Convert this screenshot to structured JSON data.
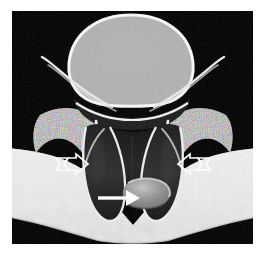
{
  "figure": {
    "kind": "medical-imaging-illustration",
    "modality_look": "axial-cross-section",
    "caption": "",
    "background_color": "#ffffff",
    "scan_background_color": "#000000",
    "frame": {
      "x": 12,
      "y": 11,
      "width": 241,
      "height": 233
    }
  },
  "palette": {
    "black": "#000000",
    "canal_dark": "#1d1d1d",
    "nerve_dark": "#262626",
    "bone_mid": "#9a9a9a",
    "bone_speckle_light": "#cfcfcf",
    "bone_speckle_dark": "#6d6d6d",
    "cortex_bright": "#f2f2f2",
    "soft_tissue": "#e2e2e2",
    "soft_tissue_shadow": "#bdbdbd",
    "fragment_gray": "#8d8d8d",
    "fragment_highlight": "#c8c8c8",
    "arrow_white": "#ffffff"
  },
  "anatomy": {
    "vertebral_body": {
      "label": "vertebral body",
      "fill": "#a6a6a6",
      "rim": "#f0f0f0",
      "texture": "trabecular-speckle",
      "center": {
        "x": 119,
        "y": 52
      },
      "radius_x": 62,
      "radius_y": 47
    },
    "posterior_cortex": {
      "label": "posterior vertebral cortex",
      "fill": "#efefef"
    },
    "disc_margin": {
      "label": "posterior disc margin",
      "fill": "#1f1f1f"
    },
    "spinal_canal": {
      "label": "spinal canal / thecal sac",
      "fill": "#1b1b1b",
      "outline": "#f4f4f4"
    },
    "nerve_root_left": {
      "label": "left nerve root sleeve",
      "fill": "#242424",
      "outline": "#f0f0f0"
    },
    "nerve_root_right": {
      "label": "right nerve root sleeve",
      "fill": "#242424",
      "outline": "#f0f0f0"
    },
    "lamina_left": {
      "label": "left lamina / facet",
      "fill": "#9c9c9c",
      "texture": "trabecular-speckle"
    },
    "lamina_right": {
      "label": "right lamina / facet",
      "fill": "#9c9c9c",
      "texture": "trabecular-speckle"
    },
    "transverse_process_left": {
      "label": "left transverse process",
      "fill": "#b4b4b4"
    },
    "transverse_process_right": {
      "label": "right transverse process",
      "fill": "#b4b4b4"
    },
    "paraspinal_tissue": {
      "label": "paraspinal soft tissue band",
      "fill": "#e4e4e4",
      "texture": "mottled"
    },
    "disc_fragment": {
      "label": "herniated disc fragment",
      "fill": "#8d8d8d",
      "highlight": "#c6c6c6",
      "center": {
        "x": 136,
        "y": 182
      },
      "radius_x": 22,
      "radius_y": 15
    }
  },
  "annotations": {
    "solid_arrow": {
      "name": "disc-fragment-arrow",
      "style": "solid",
      "color": "#ffffff",
      "direction": "right",
      "tip": {
        "x": 124,
        "y": 187
      },
      "tail": {
        "x": 98,
        "y": 187
      },
      "points_at": "herniated disc fragment"
    },
    "open_arrow_left": {
      "name": "left-open-arrow",
      "style": "hollow-outline",
      "color": "#ffffff",
      "direction": "right",
      "tip": {
        "x": 82,
        "y": 153
      },
      "tail": {
        "x": 56,
        "y": 153
      },
      "points_at": "left lateral recess"
    },
    "open_arrow_right": {
      "name": "right-open-arrow",
      "style": "hollow-outline",
      "color": "#ffffff",
      "direction": "left",
      "tip": {
        "x": 181,
        "y": 153
      },
      "tail": {
        "x": 207,
        "y": 153
      },
      "points_at": "right lateral recess"
    }
  }
}
